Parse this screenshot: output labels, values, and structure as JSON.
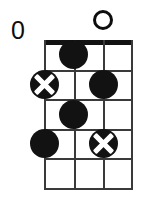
{
  "diagram": {
    "type": "chord-diagram",
    "instrument_strings": 4,
    "fret_count": 5,
    "position_label": "0",
    "nut_shown": true,
    "colors": {
      "ink": "#121212",
      "grid": "#3a3a3a",
      "background": "#ffffff",
      "dot_fill": "#121212",
      "x_mark": "#ffffff"
    },
    "geometry": {
      "grid_left": 44,
      "grid_right": 133,
      "grid_top": 40,
      "grid_bottom": 188,
      "nut_height": 5,
      "string_spacing": 29.67,
      "fret_spacing": 29.6,
      "dot_diameter": 29
    },
    "string_markers": [
      {
        "string": 1,
        "marker": "none",
        "glyph": ""
      },
      {
        "string": 2,
        "marker": "none",
        "glyph": ""
      },
      {
        "string": 3,
        "marker": "open",
        "glyph": "O"
      },
      {
        "string": 4,
        "marker": "none",
        "glyph": ""
      }
    ],
    "dots": [
      {
        "string": 2,
        "fret": 1,
        "style": "filled",
        "label": ""
      },
      {
        "string": 1,
        "fret": 2,
        "style": "circled-x",
        "label": ""
      },
      {
        "string": 3,
        "fret": 2,
        "style": "filled",
        "label": ""
      },
      {
        "string": 2,
        "fret": 3,
        "style": "filled",
        "label": ""
      },
      {
        "string": 1,
        "fret": 4,
        "style": "filled",
        "label": ""
      },
      {
        "string": 3,
        "fret": 4,
        "style": "circled-x",
        "label": ""
      }
    ]
  },
  "chart_data": {
    "type": "table",
    "xlabel": "String",
    "ylabel": "Fret",
    "categories": [
      "String 1",
      "String 2",
      "String 3",
      "String 4"
    ],
    "values": [
      4,
      3,
      4,
      0
    ],
    "grid": true,
    "legend": "none",
    "annotations": [
      "0",
      "O"
    ]
  }
}
